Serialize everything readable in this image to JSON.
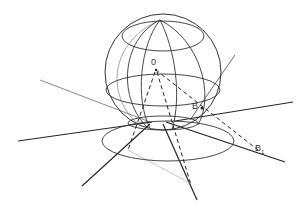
{
  "labels": {
    "origin": "0",
    "point_b": "B",
    "point_b1": "B",
    "point_b1_sub": "1"
  },
  "colors": {
    "line": "#222222",
    "light_line": "#9a9a9a",
    "background": "#ffffff"
  }
}
